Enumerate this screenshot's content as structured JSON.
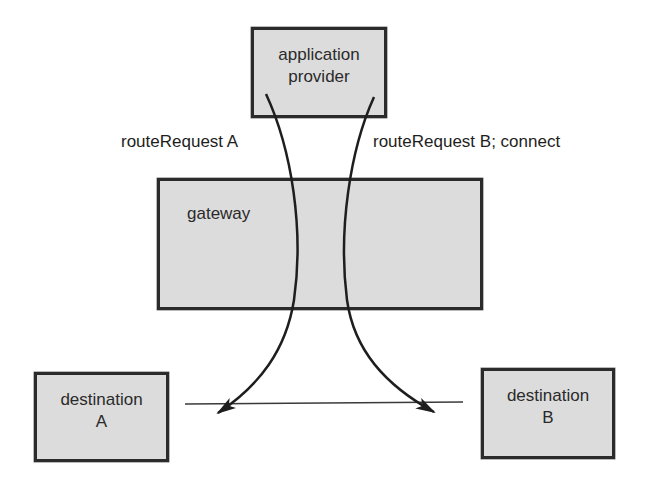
{
  "diagram": {
    "nodes": {
      "app_provider": {
        "line1": "application",
        "line2": "provider"
      },
      "gateway": {
        "label": "gateway"
      },
      "destination_a": {
        "line1": "destination",
        "line2": "A"
      },
      "destination_b": {
        "line1": "destination",
        "line2": "B"
      }
    },
    "edges": {
      "route_a": {
        "label": "routeRequest A",
        "from": "application provider",
        "to": "destination A"
      },
      "route_b": {
        "label": "routeRequest B; connect",
        "from": "application provider",
        "to": "destination B"
      }
    },
    "colors": {
      "box_fill": "#dcdcdc",
      "stroke": "#2b2b2b",
      "background": "#ffffff"
    }
  }
}
